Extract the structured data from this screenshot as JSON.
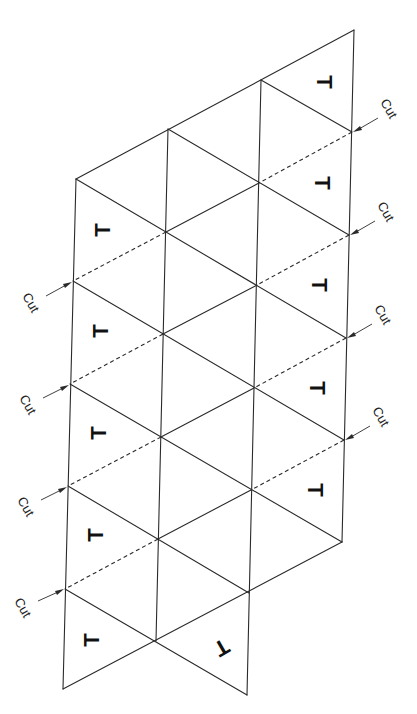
{
  "diagram": {
    "line_color": "#2a2a2a",
    "background": "#ffffff",
    "cut_label": "Cut",
    "tab_mark": "T",
    "columns": {
      "A": {
        "x_top": 76,
        "x_bottom": 63,
        "y": [
          179,
          281,
          384,
          486,
          589,
          689
        ]
      },
      "B": {
        "y": [
          129,
          232,
          334,
          437,
          539,
          641
        ]
      },
      "C": {
        "y": [
          80,
          183,
          285,
          388,
          490,
          593,
          695
        ]
      },
      "D": {
        "y": [
          30,
          132,
          235,
          338,
          440,
          542
        ]
      }
    },
    "left_cuts": [
      {
        "label": "Cut",
        "target": [
          73,
          281
        ]
      },
      {
        "label": "Cut",
        "target": [
          70,
          384
        ]
      },
      {
        "label": "Cut",
        "target": [
          68,
          486
        ]
      },
      {
        "label": "Cut",
        "target": [
          65,
          589
        ]
      }
    ],
    "right_cuts": [
      {
        "label": "Cut",
        "target": [
          352,
          132
        ]
      },
      {
        "label": "Cut",
        "target": [
          349,
          235
        ]
      },
      {
        "label": "Cut",
        "target": [
          346,
          338
        ]
      },
      {
        "label": "Cut",
        "target": [
          344,
          440
        ]
      }
    ],
    "left_tabs": [
      {
        "label": "T",
        "pos": [
          102,
          230
        ],
        "rotation": -90
      },
      {
        "label": "T",
        "pos": [
          100,
          331
        ],
        "rotation": -90
      },
      {
        "label": "T",
        "pos": [
          98,
          433
        ],
        "rotation": -90
      },
      {
        "label": "T",
        "pos": [
          95,
          535
        ],
        "rotation": -90
      },
      {
        "label": "T",
        "pos": [
          91,
          640
        ],
        "rotation": -90
      }
    ],
    "right_tabs": [
      {
        "label": "T",
        "pos": [
          325,
          82
        ],
        "rotation": 90
      },
      {
        "label": "T",
        "pos": [
          323,
          183
        ],
        "rotation": 90
      },
      {
        "label": "T",
        "pos": [
          320,
          285
        ],
        "rotation": 90
      },
      {
        "label": "T",
        "pos": [
          318,
          388
        ],
        "rotation": 90
      },
      {
        "label": "T",
        "pos": [
          316,
          490
        ],
        "rotation": 90
      }
    ],
    "bottom_tab": {
      "label": "T",
      "pos": [
        222,
        648
      ],
      "rotation": 150
    }
  }
}
